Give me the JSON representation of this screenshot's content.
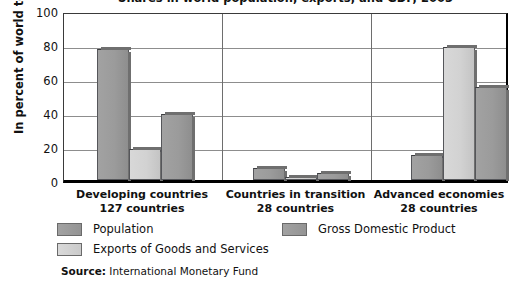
{
  "chart_data": {
    "type": "bar",
    "title": "Shares in world population, exports, and GDP, 2003",
    "xlabel": "",
    "ylabel": "In percent of world total",
    "ylim": [
      0,
      100
    ],
    "yticks": [
      100,
      80,
      60,
      40,
      20,
      0
    ],
    "grid": true,
    "legend_position": "bottom",
    "categories": [
      "Developing countries",
      "Countries in transition",
      "Advanced economies"
    ],
    "category_sublabels": [
      "127 countries",
      "28 countries",
      "28 countries"
    ],
    "series": [
      {
        "name": "Population",
        "color": "#9b9b9b",
        "values": [
          77,
          7,
          15
        ]
      },
      {
        "name": "Exports of Goods and Services",
        "color": "#d2d2d2",
        "values": [
          18,
          2,
          78
        ]
      },
      {
        "name": "Gross Domestic Product",
        "color": "#9b9b9b",
        "values": [
          39,
          4,
          55
        ]
      }
    ],
    "source_key": "Source:",
    "source_value": "International Monetary Fund"
  }
}
